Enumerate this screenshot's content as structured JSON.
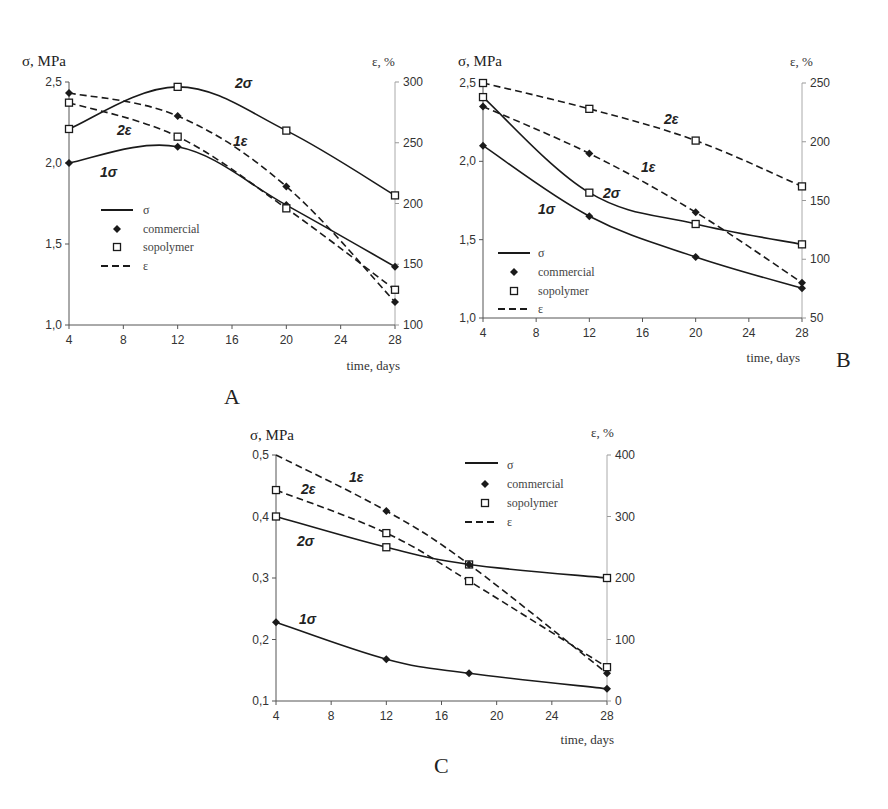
{
  "chart_data": [
    {
      "panel": "A",
      "type": "line",
      "title": "",
      "xlabel": "time, days",
      "ylabel": "σ, MPa",
      "y2label": "ε, %",
      "x_ticks": [
        4,
        8,
        12,
        16,
        20,
        24,
        28
      ],
      "y_ticks": [
        "1,0",
        "1,5",
        "2,0",
        "2,5"
      ],
      "y2_ticks": [
        "100",
        "150",
        "200",
        "250",
        "300"
      ],
      "xlim": [
        4,
        28
      ],
      "ylim": [
        1.0,
        2.5
      ],
      "y2lim": [
        100,
        300
      ],
      "legend": [
        "σ",
        "commercial",
        "sopolymer",
        "ε"
      ],
      "series": [
        {
          "name": "1σ",
          "material": "commercial",
          "quantity": "σ",
          "axis": "left",
          "x": [
            4,
            12,
            20,
            28
          ],
          "values": [
            2.0,
            2.1,
            1.74,
            1.36
          ]
        },
        {
          "name": "2σ",
          "material": "sopolymer",
          "quantity": "σ",
          "axis": "left",
          "x": [
            4,
            12,
            20,
            28
          ],
          "values": [
            2.21,
            2.47,
            2.2,
            1.8
          ]
        },
        {
          "name": "1ε",
          "material": "commercial",
          "quantity": "ε",
          "axis": "right",
          "x": [
            4,
            12,
            20,
            28
          ],
          "values": [
            291,
            272,
            214,
            119
          ]
        },
        {
          "name": "2ε",
          "material": "sopolymer",
          "quantity": "ε",
          "axis": "right",
          "x": [
            4,
            12,
            20,
            28
          ],
          "values": [
            283,
            255,
            196,
            129
          ]
        }
      ]
    },
    {
      "panel": "B",
      "type": "line",
      "title": "",
      "xlabel": "time, days",
      "ylabel": "σ, MPa",
      "y2label": "ε, %",
      "x_ticks": [
        4,
        8,
        12,
        16,
        20,
        24,
        28
      ],
      "y_ticks": [
        "1,0",
        "1,5",
        "2,0",
        "2,5"
      ],
      "y2_ticks": [
        "50",
        "100",
        "150",
        "200",
        "250"
      ],
      "xlim": [
        4,
        28
      ],
      "ylim": [
        1.0,
        2.5
      ],
      "y2lim": [
        50,
        250
      ],
      "legend": [
        "σ",
        "commercial",
        "sopolymer",
        "ε"
      ],
      "series": [
        {
          "name": "1σ",
          "material": "commercial",
          "quantity": "σ",
          "axis": "left",
          "x": [
            4,
            12,
            20,
            28
          ],
          "values": [
            2.1,
            1.65,
            1.39,
            1.19
          ]
        },
        {
          "name": "2σ",
          "material": "sopolymer",
          "quantity": "σ",
          "axis": "left",
          "x": [
            4,
            12,
            20,
            28
          ],
          "values": [
            2.41,
            1.8,
            1.6,
            1.47
          ]
        },
        {
          "name": "1ε",
          "material": "commercial",
          "quantity": "ε",
          "axis": "right",
          "x": [
            4,
            12,
            20,
            28
          ],
          "values": [
            230,
            190,
            140,
            80
          ]
        },
        {
          "name": "2ε",
          "material": "sopolymer",
          "quantity": "ε",
          "axis": "right",
          "x": [
            4,
            12,
            20,
            28
          ],
          "values": [
            250,
            228,
            201,
            162
          ]
        }
      ]
    },
    {
      "panel": "C",
      "type": "line",
      "title": "",
      "xlabel": "time, days",
      "ylabel": "σ, MPa",
      "y2label": "ε, %",
      "x_ticks": [
        4,
        8,
        12,
        16,
        20,
        24,
        28
      ],
      "y_ticks": [
        "0,1",
        "0,2",
        "0,3",
        "0,4",
        "0,5"
      ],
      "y2_ticks": [
        "0",
        "100",
        "200",
        "300",
        "400"
      ],
      "xlim": [
        4,
        28
      ],
      "ylim": [
        0.1,
        0.5
      ],
      "y2lim": [
        0,
        400
      ],
      "legend": [
        "σ",
        "commercial",
        "sopolymer",
        "ε"
      ],
      "series": [
        {
          "name": "1σ",
          "material": "commercial",
          "quantity": "σ",
          "axis": "left",
          "x": [
            4,
            12,
            18,
            28
          ],
          "values": [
            0.228,
            0.168,
            0.145,
            0.12
          ]
        },
        {
          "name": "2σ",
          "material": "sopolymer",
          "quantity": "σ",
          "axis": "left",
          "x": [
            4,
            12,
            18,
            28
          ],
          "values": [
            0.4,
            0.35,
            0.322,
            0.3
          ]
        },
        {
          "name": "1ε",
          "material": "commercial",
          "quantity": "ε",
          "axis": "right",
          "x": [
            4,
            12,
            18,
            28
          ],
          "values": [
            400,
            309,
            222,
            45
          ]
        },
        {
          "name": "2ε",
          "material": "sopolymer",
          "quantity": "ε",
          "axis": "right",
          "x": [
            4,
            12,
            18,
            28
          ],
          "values": [
            343,
            273,
            195,
            55
          ]
        }
      ]
    }
  ],
  "panels": {
    "A": {
      "letter": "A",
      "ylabel": "σ, MPa",
      "y2label": "ε, %",
      "xlabel": "time, days"
    },
    "B": {
      "letter": "B",
      "ylabel": "σ, MPa",
      "y2label": "ε, %",
      "xlabel": "time, days"
    },
    "C": {
      "letter": "C",
      "ylabel": "σ, MPa",
      "y2label": "ε, %",
      "xlabel": "time, days"
    }
  },
  "legend": {
    "sigma": "σ",
    "commercial": "commercial",
    "sopolymer": "sopolymer",
    "epsilon": "ε"
  },
  "colors": {
    "line": "#1a1a1a",
    "axis": "#555555",
    "background": "#ffffff"
  }
}
